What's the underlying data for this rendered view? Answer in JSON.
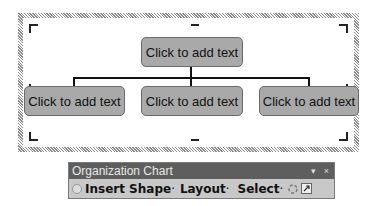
{
  "diagram": {
    "nodes": [
      {
        "id": "top",
        "label": "Click to add text"
      },
      {
        "id": "left",
        "label": "Click to add text"
      },
      {
        "id": "middle",
        "label": "Click to add text"
      },
      {
        "id": "right",
        "label": "Click to add text"
      }
    ]
  },
  "toolbar": {
    "title": "Organization Chart",
    "dropdown_glyph": "▾",
    "close_glyph": "×",
    "items": [
      {
        "label": "Insert Shape",
        "suffix": " ·"
      },
      {
        "label": "Layout",
        "suffix": "·"
      },
      {
        "label": "Select",
        "suffix": "·"
      }
    ]
  }
}
